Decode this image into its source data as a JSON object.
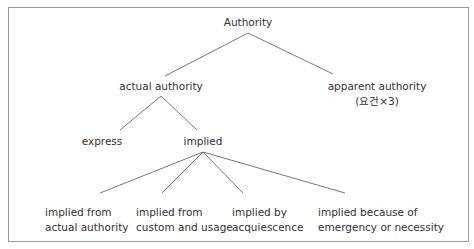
{
  "diagram": {
    "root": {
      "label": "Authority"
    },
    "level1": [
      {
        "id": "actual",
        "label": "actual authority"
      },
      {
        "id": "apparent",
        "label": "apparent authority",
        "sublabel": "(요건×3)"
      }
    ],
    "level2": [
      {
        "id": "express",
        "label": "express",
        "parent": "actual"
      },
      {
        "id": "implied",
        "label": "implied",
        "parent": "actual"
      }
    ],
    "level3": [
      {
        "id": "implied-actual",
        "parent": "implied",
        "line1": "implied from",
        "line2": "actual authority"
      },
      {
        "id": "implied-custom",
        "parent": "implied",
        "line1": "implied from",
        "line2": "custom and usage"
      },
      {
        "id": "implied-acquiescence",
        "parent": "implied",
        "line1": "implied by",
        "line2": "acquiescence"
      },
      {
        "id": "implied-emergency",
        "parent": "implied",
        "line1": "implied because of",
        "line2": "emergency or necessity"
      }
    ]
  },
  "style": {
    "line_color": "#555555",
    "border_color": "#9a9a9a",
    "text_color": "#333333"
  }
}
